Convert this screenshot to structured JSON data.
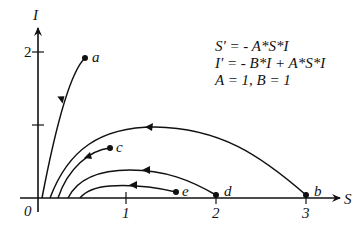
{
  "diagram": {
    "type": "phase-portrait",
    "axes": {
      "x_label": "S",
      "y_label": "I",
      "origin_label": "0",
      "x_ticks": [
        "1",
        "2",
        "3"
      ],
      "y_ticks": [
        "1",
        "2"
      ],
      "y_tick_labels_shown": [
        "2"
      ]
    },
    "equations": [
      "S' = - A*S*I",
      "I' = - B*I + A*S*I",
      "A = 1, B = 1"
    ],
    "trajectories": [
      {
        "label": "a",
        "start": [
          0.5,
          1.9
        ]
      },
      {
        "label": "b",
        "start": [
          3,
          0.05
        ]
      },
      {
        "label": "c",
        "start": [
          0.8,
          0.7
        ]
      },
      {
        "label": "d",
        "start": [
          2,
          0.05
        ]
      },
      {
        "label": "e",
        "start": [
          1.5,
          0.08
        ]
      }
    ],
    "colors": {
      "ink": "#111111",
      "background": "#ffffff"
    }
  }
}
